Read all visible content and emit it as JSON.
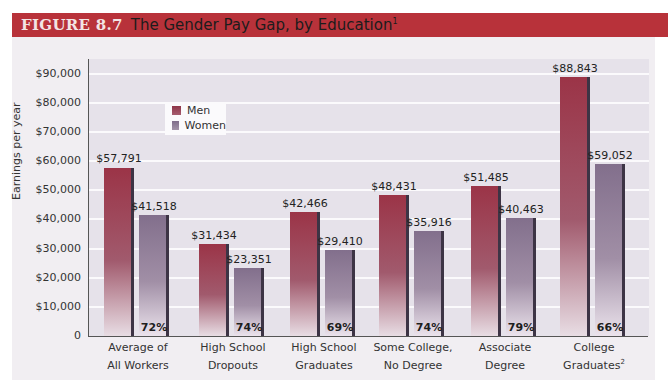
{
  "header": {
    "figure_number": "FIGURE 8.7",
    "title": "The Gender Pay Gap, by Education",
    "title_footnote": "1"
  },
  "legend": {
    "men_label": "Men",
    "women_label": "Women"
  },
  "colors": {
    "header_bg": "#b8323a",
    "men": "#9b3447",
    "women": "#826f8c"
  },
  "y_axis": {
    "label": "Earnings per year",
    "ticks": [
      "0",
      "$10,000",
      "$20,000",
      "$30,000",
      "$40,000",
      "$50,000",
      "$60,000",
      "$70,000",
      "$80,000",
      "$90,000"
    ]
  },
  "groups": [
    {
      "line1": "Average of",
      "line2": "All Workers",
      "sup": "",
      "men": "$57,791",
      "women": "$41,518",
      "pct": "72%"
    },
    {
      "line1": "High School",
      "line2": "Dropouts",
      "sup": "",
      "men": "$31,434",
      "women": "$23,351",
      "pct": "74%"
    },
    {
      "line1": "High School",
      "line2": "Graduates",
      "sup": "",
      "men": "$42,466",
      "women": "$29,410",
      "pct": "69%"
    },
    {
      "line1": "Some College,",
      "line2": "No Degree",
      "sup": "",
      "men": "$48,431",
      "women": "$35,916",
      "pct": "74%"
    },
    {
      "line1": "Associate",
      "line2": "Degree",
      "sup": "",
      "men": "$51,485",
      "women": "$40,463",
      "pct": "79%"
    },
    {
      "line1": "College",
      "line2": "Graduates",
      "sup": "2",
      "men": "$88,843",
      "women": "$59,052",
      "pct": "66%"
    }
  ],
  "chart_data": {
    "type": "bar",
    "title": "FIGURE 8.7 The Gender Pay Gap, by Education",
    "xlabel": "",
    "ylabel": "Earnings per year",
    "ylim": [
      0,
      90000
    ],
    "grid": true,
    "legend_position": "upper-left inside",
    "categories": [
      "Average of All Workers",
      "High School Dropouts",
      "High School Graduates",
      "Some College, No Degree",
      "Associate Degree",
      "College Graduates"
    ],
    "series": [
      {
        "name": "Men",
        "values": [
          57791,
          31434,
          42466,
          48431,
          51485,
          88843
        ]
      },
      {
        "name": "Women",
        "values": [
          41518,
          23351,
          29410,
          35916,
          40463,
          59052
        ]
      }
    ],
    "annotations": {
      "women_to_men_ratio": [
        "72%",
        "74%",
        "69%",
        "74%",
        "79%",
        "66%"
      ]
    },
    "y_ticks": [
      0,
      10000,
      20000,
      30000,
      40000,
      50000,
      60000,
      70000,
      80000,
      90000
    ]
  }
}
